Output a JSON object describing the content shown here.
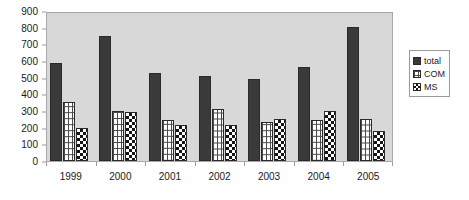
{
  "chart_data": {
    "type": "bar",
    "title": "",
    "subtitle": "",
    "xlabel": "",
    "ylabel": "",
    "categories": [
      "1999",
      "2000",
      "2001",
      "2002",
      "2003",
      "2004",
      "2005"
    ],
    "series": [
      {
        "name": "total",
        "values": [
          590,
          750,
          530,
          510,
          495,
          565,
          805
        ]
      },
      {
        "name": "COM",
        "values": [
          355,
          300,
          245,
          315,
          235,
          245,
          255
        ]
      },
      {
        "name": "MS",
        "values": [
          200,
          295,
          215,
          215,
          255,
          300,
          180
        ]
      }
    ],
    "ylim": [
      0,
      900
    ],
    "ytick_values": [
      900,
      800,
      700,
      600,
      500,
      400,
      300,
      200,
      100,
      0
    ],
    "ytick_labels": [
      "900",
      "800",
      "700",
      "600",
      "500",
      "400",
      "300",
      "200",
      "100",
      "0"
    ],
    "grid": false,
    "legend_position": "right-outside",
    "legend_entries": [
      "total",
      "COM",
      "MS"
    ],
    "annotations": []
  },
  "style": {
    "plot_background": "#d8d8d8",
    "page_background": "#ffffff",
    "axis_color": "#9a9a9a",
    "series_colors": {
      "total": "#3a3a3a",
      "COM": "#ffffff",
      "MS": "#ffffff"
    },
    "series_patterns": {
      "total": "solid",
      "COM": "grid-lattice",
      "MS": "checkerboard"
    }
  }
}
